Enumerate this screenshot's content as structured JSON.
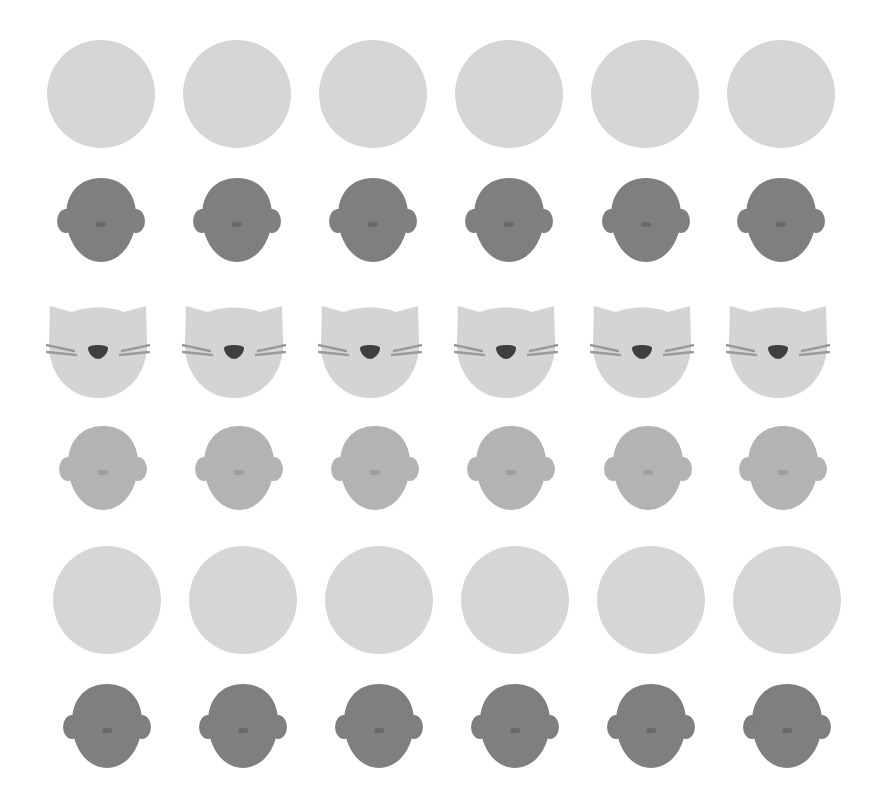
{
  "colors": {
    "background": "#ffffff",
    "circle": "#d6d6d6",
    "head_dark": "#7f7f7f",
    "head_dark_nose": "#6a6a6a",
    "head_mid": "#b3b3b3",
    "head_mid_nose": "#9e9e9e",
    "cat_face": "#d4d4d4",
    "cat_whisker": "#9a9a9a",
    "cat_nose": "#3f3f3f"
  },
  "grid": {
    "rows": [
      {
        "type": "circle",
        "icon": "placeholder-circle-icon",
        "y": 94,
        "xs": [
          101,
          237,
          373,
          509,
          645,
          781
        ]
      },
      {
        "type": "head-dark",
        "icon": "person-head-icon",
        "y": 220,
        "xs": [
          101,
          237,
          373,
          509,
          646,
          781
        ]
      },
      {
        "type": "cat",
        "icon": "cat-face-icon",
        "y": 350,
        "xs": [
          98,
          234,
          370,
          506,
          642,
          778
        ]
      },
      {
        "type": "head-mid",
        "icon": "person-head-icon",
        "y": 468,
        "xs": [
          103,
          239,
          375,
          511,
          648,
          783
        ]
      },
      {
        "type": "circle",
        "icon": "placeholder-circle-icon",
        "y": 600,
        "xs": [
          107,
          243,
          379,
          515,
          651,
          787
        ]
      },
      {
        "type": "head-dark",
        "icon": "person-head-icon",
        "y": 726,
        "xs": [
          107,
          243,
          379,
          515,
          651,
          787
        ]
      }
    ]
  }
}
